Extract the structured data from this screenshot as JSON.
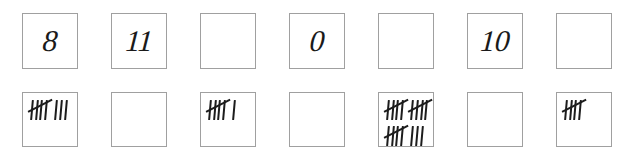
{
  "worksheet": {
    "title": "Tally marks and numerals matching worksheet",
    "ink_color": "#1c1c1c",
    "box_border_color": "#a0a0a0",
    "background_color": "#ffffff",
    "column_count": 7,
    "row_labels": [
      "numeral row",
      "tally row"
    ],
    "columns": [
      {
        "index": 1,
        "numeral": "8",
        "numeral_filled": true,
        "tally_filled": true,
        "tally_total": 8,
        "tally_lines": [
          [
            5,
            3
          ]
        ]
      },
      {
        "index": 2,
        "numeral": "11",
        "numeral_filled": true,
        "tally_filled": false,
        "tally_total": null,
        "tally_lines": []
      },
      {
        "index": 3,
        "numeral": "",
        "numeral_filled": false,
        "tally_filled": true,
        "tally_total": 6,
        "tally_lines": [
          [
            5,
            1
          ]
        ]
      },
      {
        "index": 4,
        "numeral": "0",
        "numeral_filled": true,
        "tally_filled": false,
        "tally_total": null,
        "tally_lines": []
      },
      {
        "index": 5,
        "numeral": "",
        "numeral_filled": false,
        "tally_filled": true,
        "tally_total": 18,
        "tally_lines": [
          [
            5,
            5
          ],
          [
            5,
            3
          ]
        ]
      },
      {
        "index": 6,
        "numeral": "10",
        "numeral_filled": true,
        "tally_filled": false,
        "tally_total": null,
        "tally_lines": []
      },
      {
        "index": 7,
        "numeral": "",
        "numeral_filled": false,
        "tally_filled": true,
        "tally_total": 5,
        "tally_lines": [
          [
            5
          ]
        ]
      }
    ]
  },
  "layout": {
    "canvas_width": 644,
    "canvas_height": 165,
    "box_size": 56,
    "column_pitch": 89,
    "first_column_left": 22,
    "numeral_row_top": 13,
    "tally_row_top": 92
  }
}
